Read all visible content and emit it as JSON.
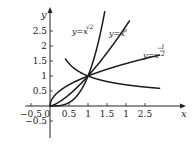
{
  "chart_data": {
    "type": "line",
    "title": "",
    "xlabel": "x",
    "ylabel": "y",
    "xlim": [
      -0.5,
      3
    ],
    "ylim": [
      -0.6,
      2.9
    ],
    "grid": false,
    "legend": "inline labels",
    "x_tick_labels": [
      "-0.5",
      "0",
      "0.5",
      "1",
      "1.5",
      "1",
      "2.5"
    ],
    "x_tick_values": [
      -0.5,
      0,
      0.5,
      1,
      1.5,
      2,
      2.5
    ],
    "y_tick_labels": [
      "2.5",
      "2",
      "1.5",
      "1",
      "0.5",
      "-0.5"
    ],
    "y_tick_values": [
      2.5,
      2,
      1.5,
      1,
      0.5,
      -0.5
    ],
    "series": [
      {
        "name": "y=x^√2",
        "label_base": "y=x",
        "label_exp": "√2",
        "exponent": 1.41421356,
        "x_range": [
          0,
          2.1
        ]
      },
      {
        "name": "y=x^π",
        "label_base": "y=x",
        "label_exp": "π",
        "exponent": 3.14159265,
        "x_range": [
          0,
          1.45
        ]
      },
      {
        "name": "y=x^(1/2)",
        "label_base": "y=x",
        "label_exp": "1/2",
        "exponent": 0.5,
        "x_range": [
          0,
          2.9
        ]
      },
      {
        "name": "y=x^(-1/2)",
        "label_base": "y=x",
        "label_exp": "-1/2",
        "exponent": -0.5,
        "x_range": [
          0.4,
          2.9
        ]
      }
    ],
    "annotations": [
      "y=x^√2",
      "y=x^π",
      "y=x^-1/2"
    ]
  },
  "labels": {
    "x_axis": "x",
    "y_axis": "y",
    "origin": "0",
    "curve_sqrt2_base": "y=x",
    "curve_sqrt2_exp": "√2",
    "curve_pi_base": "y=x",
    "curve_pi_exp": "π",
    "curve_neg_half_base": "y=x",
    "curve_neg_half_exp": "1/2",
    "curve_neg_half_sign": "−"
  }
}
